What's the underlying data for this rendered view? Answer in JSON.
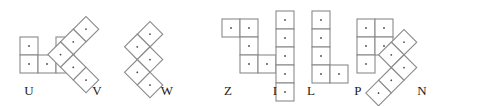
{
  "figure": {
    "cell_size": 18,
    "cell_stroke_color": "#8a8a8a",
    "cell_fill_color": "#ffffff",
    "dot_color": "#4a4a4a",
    "label_color": "#1a1a1a",
    "background_color": "#ffffff",
    "piece_count": 8
  },
  "pieces": [
    {
      "label": "U",
      "name": "u-pentomino",
      "rotation_deg": 0,
      "cell_count": 5,
      "cells": [
        [
          0,
          0
        ],
        [
          2,
          0
        ],
        [
          0,
          1
        ],
        [
          1,
          1
        ],
        [
          2,
          1
        ]
      ],
      "origin_x": 19,
      "origin_y": 36,
      "label_x": 29,
      "label_y": 84
    },
    {
      "label": "V",
      "name": "v-pentomino",
      "rotation_deg": 45,
      "cell_count": 5,
      "cells": [
        [
          0,
          0
        ],
        [
          0,
          1
        ],
        [
          0,
          2
        ],
        [
          1,
          2
        ],
        [
          2,
          2
        ]
      ],
      "origin_x": 86,
      "origin_y": 15,
      "label_x": 97,
      "label_y": 84
    },
    {
      "label": "W",
      "name": "w-pentomino",
      "rotation_deg": 45,
      "cell_count": 5,
      "cells": [
        [
          0,
          0
        ],
        [
          0,
          1
        ],
        [
          1,
          1
        ],
        [
          1,
          2
        ],
        [
          2,
          2
        ]
      ],
      "origin_x": 150,
      "origin_y": 20,
      "label_x": 167,
      "label_y": 84
    },
    {
      "label": "Z",
      "name": "z-pentomino",
      "rotation_deg": 0,
      "cell_count": 5,
      "cells": [
        [
          0,
          0
        ],
        [
          1,
          0
        ],
        [
          1,
          1
        ],
        [
          1,
          2
        ],
        [
          2,
          2
        ]
      ],
      "origin_x": 221,
      "origin_y": 18,
      "label_x": 228,
      "label_y": 84
    },
    {
      "label": "I",
      "name": "i-pentomino",
      "rotation_deg": 0,
      "cell_count": 5,
      "cells": [
        [
          0,
          0
        ],
        [
          0,
          1
        ],
        [
          0,
          2
        ],
        [
          0,
          3
        ],
        [
          0,
          4
        ]
      ],
      "origin_x": 275,
      "origin_y": 10,
      "label_x": 275,
      "label_y": 84
    },
    {
      "label": "L",
      "name": "l-pentomino",
      "rotation_deg": 0,
      "cell_count": 5,
      "cells": [
        [
          0,
          0
        ],
        [
          0,
          1
        ],
        [
          0,
          2
        ],
        [
          0,
          3
        ],
        [
          1,
          3
        ]
      ],
      "origin_x": 311,
      "origin_y": 10,
      "label_x": 311,
      "label_y": 84
    },
    {
      "label": "P",
      "name": "p-pentomino",
      "rotation_deg": 0,
      "cell_count": 5,
      "cells": [
        [
          0,
          0
        ],
        [
          1,
          0
        ],
        [
          0,
          1
        ],
        [
          1,
          1
        ],
        [
          0,
          2
        ]
      ],
      "origin_x": 356,
      "origin_y": 18,
      "label_x": 358,
      "label_y": 84
    },
    {
      "label": "N",
      "name": "n-pentomino",
      "rotation_deg": 45,
      "cell_count": 5,
      "cells": [
        [
          0,
          0
        ],
        [
          0,
          1
        ],
        [
          1,
          1
        ],
        [
          1,
          2
        ],
        [
          1,
          3
        ]
      ],
      "origin_x": 404,
      "origin_y": 28,
      "label_x": 422,
      "label_y": 84
    }
  ]
}
